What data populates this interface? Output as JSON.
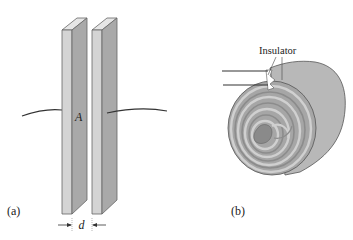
{
  "figure": {
    "panel_a": {
      "label": "(a)",
      "area_label": "A",
      "separation_label": "d",
      "description": "Parallel-plate capacitor: two plates of area A separated by distance d, each with a lead wire"
    },
    "panel_b": {
      "label": "(b)",
      "insulator_label": "Insulator",
      "description": "Rolled (spiral-wound) capacitor with insulator layers between foil sheets"
    },
    "colors": {
      "plate_front": "#d4d4d4",
      "plate_side": "#a9a9a9",
      "plate_top": "#e6e6e6",
      "roll_body": "#b3b3b3",
      "roll_dark": "#8c8c8c",
      "roll_light": "#cfcfcf",
      "outline": "#555555",
      "wire": "#333333"
    }
  }
}
